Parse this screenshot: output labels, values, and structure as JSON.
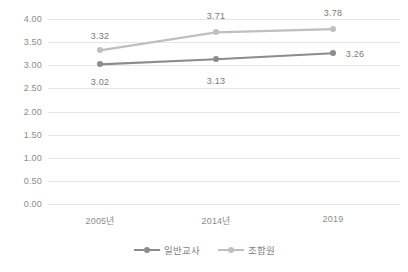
{
  "chart_data": {
    "type": "line",
    "title": "",
    "subtitle": "",
    "xlabel": "",
    "ylabel": "",
    "categories": [
      "2005년",
      "2014년",
      "2019"
    ],
    "series": [
      {
        "name": "일반교사",
        "color": "#8c8c8c",
        "values": [
          3.02,
          3.13,
          3.26
        ],
        "labels": [
          "3.02",
          "3.13",
          "3.26"
        ]
      },
      {
        "name": "조합원",
        "color": "#bfbfbf",
        "values": [
          3.32,
          3.71,
          3.78
        ],
        "labels": [
          "3.32",
          "3.71",
          "3.78"
        ]
      }
    ],
    "ylim": [
      0.0,
      4.0
    ],
    "ytick_values": [
      4.0,
      3.5,
      3.0,
      2.5,
      2.0,
      1.5,
      1.0,
      0.5,
      0.0
    ],
    "ytick_labels": [
      "4.00",
      "3.50",
      "3.00",
      "2.50",
      "2.00",
      "1.50",
      "1.00",
      "0.50",
      "0.00"
    ],
    "grid": true,
    "grid_color": "#e6e6e6",
    "legend_position": "bottom"
  }
}
